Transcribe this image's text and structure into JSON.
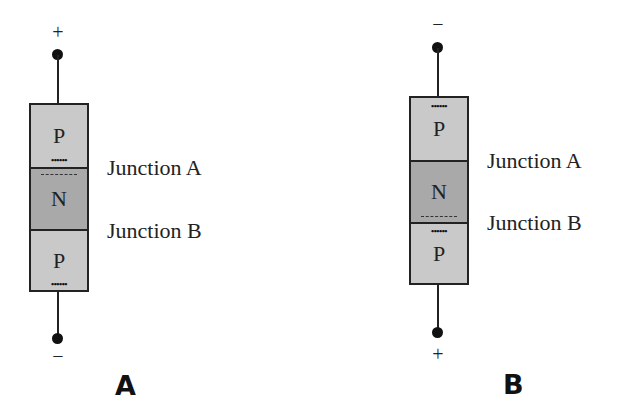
{
  "diagram_a": {
    "caption": "A",
    "top_terminal": "+",
    "bottom_terminal": "−",
    "regions": [
      "P",
      "N",
      "P"
    ],
    "junction_a_label": "Junction A",
    "junction_b_label": "Junction B",
    "holes_marker": "••••••"
  },
  "diagram_b": {
    "caption": "B",
    "top_terminal": "−",
    "bottom_terminal": "+",
    "regions": [
      "P",
      "N",
      "P"
    ],
    "junction_a_label": "Junction A",
    "junction_b_label": "Junction B",
    "holes_marker": "••••••"
  },
  "colors": {
    "p_region": "#c9c9c9",
    "n_region": "#a9a9a9",
    "outline": "#222222"
  }
}
